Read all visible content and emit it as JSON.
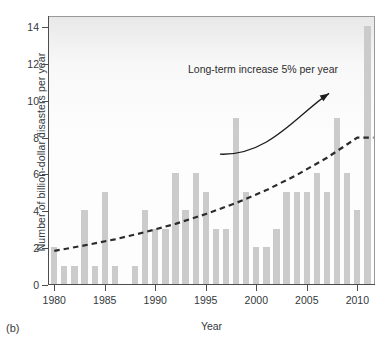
{
  "panel": {
    "letter": "(b)"
  },
  "chart_data": {
    "type": "bar",
    "title": "",
    "xlabel": "Year",
    "ylabel": "Number of billion-dollar disasters per year",
    "xlim": [
      1978.6,
      1979.0
    ],
    "ylim": [
      0,
      14.6
    ],
    "grid": false,
    "legend": null,
    "x_ticks": [
      1980,
      1985,
      1990,
      1995,
      2000,
      2005,
      2010
    ],
    "y_ticks": [
      0,
      2,
      4,
      6,
      8,
      10,
      12,
      14
    ],
    "bar_color": "#cbcbcb",
    "categories": [
      1980,
      1981,
      1982,
      1983,
      1984,
      1985,
      1986,
      1987,
      1988,
      1989,
      1990,
      1991,
      1992,
      1993,
      1994,
      1995,
      1996,
      1997,
      1998,
      1999,
      2000,
      2001,
      2002,
      2003,
      2004,
      2005,
      2006,
      2007,
      2008,
      2009,
      2010,
      2011
    ],
    "values": [
      2,
      1,
      1,
      4,
      1,
      5,
      1,
      0,
      1,
      4,
      3,
      3,
      6,
      4,
      6,
      5,
      3,
      3,
      9,
      5,
      2,
      2,
      3,
      5,
      5,
      5,
      6,
      5,
      9,
      6,
      4,
      14
    ],
    "trend": {
      "label": "Long-term increase 5% per year",
      "style": "dashed",
      "color": "#2b2b2b",
      "growth_rate_percent": 5,
      "x": [
        1980,
        1983,
        1986,
        1989,
        1992,
        1995,
        1998,
        2001,
        2004,
        2007,
        2010,
        2011.6
      ],
      "y": [
        1.85,
        2.15,
        2.48,
        2.87,
        3.32,
        3.85,
        4.45,
        5.15,
        5.97,
        6.91,
        8.0,
        8.0
      ]
    },
    "annotations": [
      {
        "text": "Long-term increase 5% per year",
        "type": "curved-arrow-label",
        "arrow_from": [
          1996.4,
          7.1
        ],
        "arrow_to": [
          2007.2,
          10.4
        ]
      }
    ]
  }
}
